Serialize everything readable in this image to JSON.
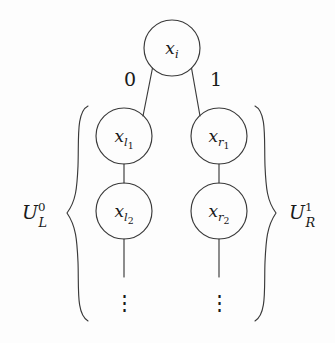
{
  "figure": {
    "type": "binary-tree-diagram",
    "background_color": "#fdfdfd",
    "ink_color": "#1a1a1a",
    "root": {
      "label_base": "x",
      "label_sub": "i",
      "cx": 172,
      "cy": 48,
      "r": 28
    },
    "edge_labels": {
      "left": "0",
      "right": "1"
    },
    "nodes": [
      {
        "id": "x-l1",
        "base": "x",
        "sub": "l",
        "subsub": "1",
        "cx": 124,
        "cy": 136,
        "r": 28
      },
      {
        "id": "x-r1",
        "base": "x",
        "sub": "r",
        "subsub": "1",
        "cx": 219,
        "cy": 136,
        "r": 28
      },
      {
        "id": "x-l2",
        "base": "x",
        "sub": "l",
        "subsub": "2",
        "cx": 124,
        "cy": 211,
        "r": 28
      },
      {
        "id": "x-r2",
        "base": "x",
        "sub": "r",
        "subsub": "2",
        "cx": 219,
        "cy": 211,
        "r": 28
      }
    ],
    "ellipses": [
      {
        "id": "left-vdots",
        "glyph": "⋮",
        "x": 124,
        "y": 302
      },
      {
        "id": "right-vdots",
        "glyph": "⋮",
        "x": 219,
        "y": 302
      }
    ],
    "braces": [
      {
        "id": "left-brace",
        "glyph": "{",
        "side": "left",
        "label_base": "U",
        "label_sub": "L",
        "label_sup": "0",
        "label_x": 33,
        "label_y": 218,
        "top": 105,
        "bottom": 322
      },
      {
        "id": "right-brace",
        "glyph": "}",
        "side": "right",
        "label_base": "U",
        "label_sub": "R",
        "label_sup": "1",
        "label_x": 302,
        "label_y": 218,
        "top": 105,
        "bottom": 322
      }
    ]
  }
}
